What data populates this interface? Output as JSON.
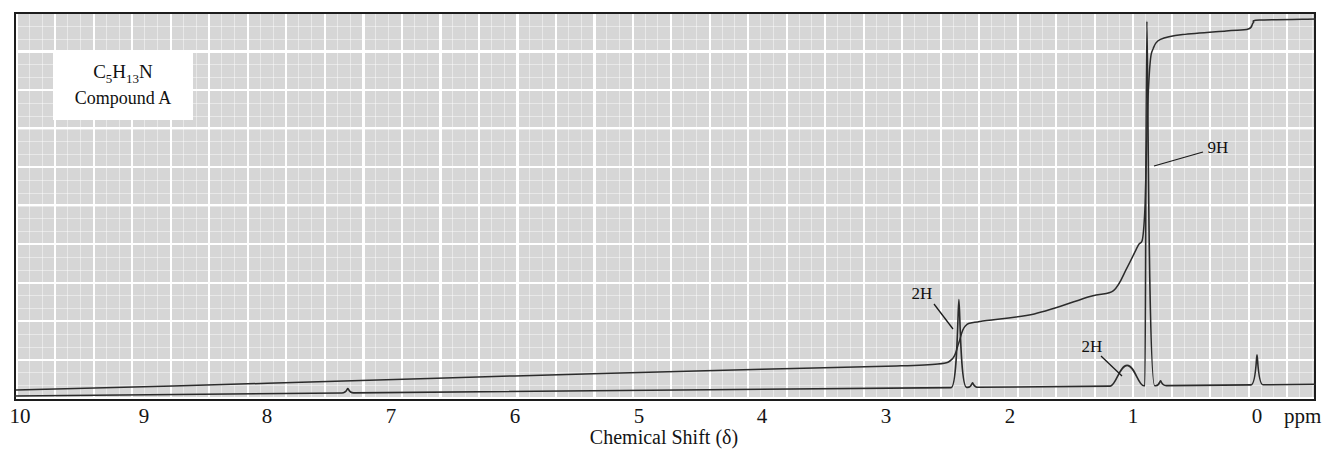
{
  "figure": {
    "compound": {
      "formula_plain": "C5H13N",
      "formula_parts": [
        {
          "text": "C",
          "sub": false
        },
        {
          "text": "5",
          "sub": true
        },
        {
          "text": "H",
          "sub": false
        },
        {
          "text": "13",
          "sub": true
        },
        {
          "text": "N",
          "sub": false
        }
      ],
      "name": "Compound A"
    }
  },
  "chart_data": {
    "type": "line",
    "subtype": "1H NMR spectrum",
    "title": "",
    "xlabel": "Chemical Shift (δ)",
    "x_unit": "ppm",
    "x_ticks": [
      10,
      9,
      8,
      7,
      6,
      5,
      4,
      3,
      2,
      1,
      0
    ],
    "x_axis_reversed": true,
    "x_range": [
      10,
      -0.5
    ],
    "grid": {
      "on": true,
      "bg_color": "#d6d6d6",
      "line_color": "#ffffff"
    },
    "trace_color": "#2b2b2b",
    "peaks": [
      {
        "ppm": 7.35,
        "integration": "",
        "height_frac": 0.012,
        "width_px": 2.0,
        "shape": "sharp"
      },
      {
        "ppm": 2.41,
        "integration": "2H",
        "height_frac": 0.235,
        "width_px": 2.6,
        "shape": "sharp"
      },
      {
        "ppm": 2.3,
        "integration": "",
        "height_frac": 0.012,
        "width_px": 2.0,
        "shape": "sharp"
      },
      {
        "ppm": 1.05,
        "integration": "2H",
        "height_frac": 0.055,
        "width_px": 7.0,
        "shape": "broad"
      },
      {
        "ppm": 0.89,
        "integration": "9H",
        "height_frac": 0.975,
        "width_px": 2.6,
        "shape": "sharp"
      },
      {
        "ppm": 0.78,
        "integration": "",
        "height_frac": 0.013,
        "width_px": 2.0,
        "shape": "sharp"
      },
      {
        "ppm": 0.0,
        "integration": "TMS reference",
        "height_frac": 0.08,
        "width_px": 1.8,
        "shape": "sharp"
      }
    ],
    "integral_trace": [
      [
        10.05,
        0.0
      ],
      [
        8.0,
        0.018
      ],
      [
        6.0,
        0.038
      ],
      [
        4.0,
        0.056
      ],
      [
        3.0,
        0.064
      ],
      [
        2.58,
        0.07
      ],
      [
        2.46,
        0.085
      ],
      [
        2.41,
        0.128
      ],
      [
        2.36,
        0.172
      ],
      [
        2.24,
        0.185
      ],
      [
        1.8,
        0.205
      ],
      [
        1.35,
        0.252
      ],
      [
        1.16,
        0.268
      ],
      [
        1.05,
        0.33
      ],
      [
        0.96,
        0.39
      ],
      [
        0.925,
        0.408
      ],
      [
        0.905,
        0.5
      ],
      [
        0.885,
        0.75
      ],
      [
        0.865,
        0.878
      ],
      [
        0.84,
        0.92
      ],
      [
        0.78,
        0.945
      ],
      [
        0.6,
        0.958
      ],
      [
        0.25,
        0.968
      ],
      [
        0.07,
        0.973
      ],
      [
        0.03,
        0.99
      ],
      [
        -0.02,
        0.997
      ],
      [
        -0.49,
        1.0
      ]
    ],
    "annotations": [
      {
        "text": "2H",
        "target_ppm": 2.41,
        "label_x": 922,
        "label_y": 299,
        "line": [
          934,
          304,
          953,
          329
        ]
      },
      {
        "text": "2H",
        "target_ppm": 1.05,
        "label_x": 1092,
        "label_y": 352,
        "line": [
          1101,
          356,
          1122,
          376
        ]
      },
      {
        "text": "9H",
        "target_ppm": 0.89,
        "label_x": 1218,
        "label_y": 153,
        "line": [
          1203,
          152,
          1154,
          166
        ]
      }
    ]
  }
}
